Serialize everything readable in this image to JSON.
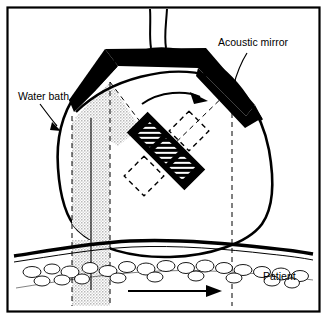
{
  "figure": {
    "frame_color": "#000000",
    "background_color": "#ffffff"
  },
  "labels": [
    {
      "id": "acoustic-mirror",
      "text": "Acoustic mirror",
      "x": 218,
      "y": 46,
      "anchor": "start",
      "leader": {
        "x1": 248,
        "y1": 52,
        "x2": 232,
        "y2": 88
      }
    },
    {
      "id": "water-bath",
      "text": "Water bath",
      "x": 18,
      "y": 100,
      "anchor": "start",
      "leader": {
        "x1": 40,
        "y1": 104,
        "x2": 58,
        "y2": 127
      }
    },
    {
      "id": "patient",
      "text": "Patient",
      "x": 263,
      "y": 280,
      "anchor": "start",
      "leader": null
    }
  ],
  "components": {
    "water_bath": {
      "name": "water-bath-dome",
      "outline_color": "#000000",
      "fill_color": "#ffffff",
      "stroke_width": 2.6
    },
    "acoustic_mirror": {
      "name": "acoustic-mirror-body",
      "fill_color": "#000000"
    },
    "transducer": {
      "name": "transducer-bar",
      "fill_color": "#000000",
      "hatch_color": "#ffffff",
      "segments": 3,
      "rotation_deg": 45
    },
    "rotation_positions": {
      "name": "transducer-rotation-outline",
      "style": "dashed",
      "color": "#000000",
      "count": 2
    },
    "beam": {
      "name": "ultrasound-beam",
      "fill_color": "#dcdcdc",
      "edge_style": "dashed"
    },
    "cable": {
      "name": "cable-tube",
      "color": "#000000",
      "lines": 2
    },
    "patient_tissue": {
      "name": "patient-tissue-layer",
      "skin_color": "#000000",
      "fat_outline_color": "#000000",
      "fill_color": "#ffffff"
    }
  },
  "arrows": {
    "rotation": {
      "name": "rotation-arrow",
      "direction": "clockwise",
      "color": "#000000"
    },
    "scan": {
      "name": "scan-direction-arrow",
      "direction": "right",
      "color": "#000000"
    }
  },
  "guide_lines": {
    "name": "beam-axis-guides",
    "style": "dashed",
    "color": "#000000",
    "vertical_count": 3,
    "diagonal_count": 2
  }
}
